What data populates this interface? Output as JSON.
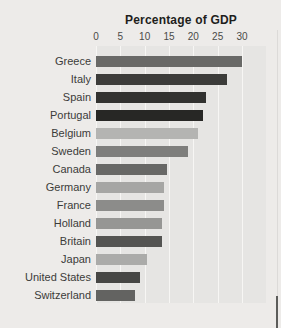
{
  "page": {
    "background": "#edebe9",
    "plot_background": "#e6e5e3",
    "gridline_color": "#f7f6f4",
    "title_color": "#1e1e1c",
    "tick_label_color": "#4a4a48",
    "category_label_color": "#3b3b39"
  },
  "chart_data": {
    "type": "bar",
    "orientation": "horizontal",
    "title": "Percentage of GDP",
    "xlabel": "",
    "ylabel": "",
    "axis_position": "top",
    "xlim": [
      0,
      30
    ],
    "x_ticks": [
      0,
      5,
      10,
      15,
      20,
      25,
      30
    ],
    "grid": "vertical white gridlines on light gray plot background",
    "legend": "none",
    "categories": [
      "Greece",
      "Italy",
      "Spain",
      "Portugal",
      "Belgium",
      "Sweden",
      "Canada",
      "Germany",
      "France",
      "Holland",
      "Britain",
      "Japan",
      "United States",
      "Switzerland"
    ],
    "values": [
      30,
      27,
      22.5,
      22,
      21,
      19,
      14.5,
      14,
      14,
      13.5,
      13.5,
      10.5,
      9,
      8
    ],
    "bar_colors": [
      "#696967",
      "#3c3c3a",
      "#323230",
      "#272725",
      "#b4b4b2",
      "#7e7e7c",
      "#686866",
      "#a6a6a4",
      "#8c8c8a",
      "#969694",
      "#545452",
      "#ababa9",
      "#474745",
      "#636361"
    ]
  }
}
